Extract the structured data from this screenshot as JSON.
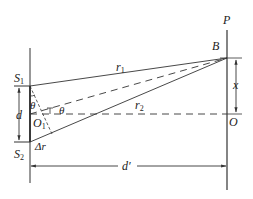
{
  "diagram": {
    "type": "double-slit interference geometry",
    "colors": {
      "line": "#333333",
      "background": "#ffffff"
    },
    "labels": {
      "P": "P",
      "B": "B",
      "S1": "S",
      "S1_sub": "1",
      "S2": "S",
      "S2_sub": "2",
      "r1": "r",
      "r1_sub": "1",
      "r2": "r",
      "r2_sub": "2",
      "x": "x",
      "d": "d",
      "O1": "O",
      "O1_sub": "1",
      "O": "O",
      "theta_left": "θ",
      "theta_right": "θ",
      "delta_r": "Δr",
      "d_prime": "d′"
    },
    "points": {
      "S1": [
        30,
        86
      ],
      "S2": [
        30,
        142
      ],
      "O1": [
        30,
        114
      ],
      "B": [
        227,
        58
      ],
      "O": [
        227,
        114
      ]
    },
    "lines": {
      "slit_screen_x": 30,
      "observation_screen_x": 227,
      "dimension_d_x": 19,
      "dimension_x_x": 236,
      "dimension_d_prime_y": 166
    }
  }
}
